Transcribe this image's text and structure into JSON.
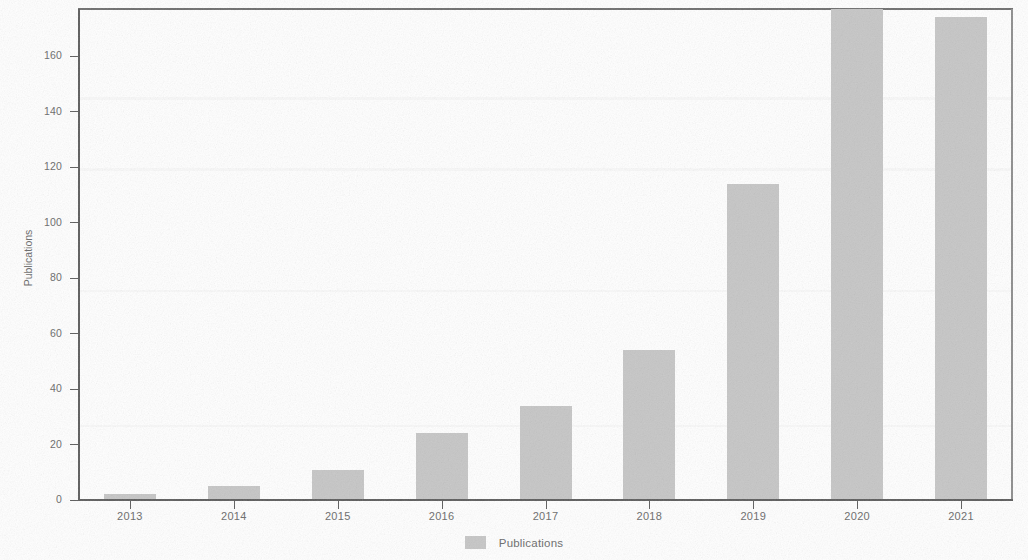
{
  "chart_data": {
    "type": "bar",
    "title": "",
    "subtitle": "",
    "xlabel": "",
    "ylabel": "Publications",
    "categories": [
      "2013",
      "2014",
      "2015",
      "2016",
      "2017",
      "2018",
      "2019",
      "2020",
      "2021"
    ],
    "values": [
      2,
      5,
      11,
      24,
      34,
      54,
      114,
      177,
      174
    ],
    "series": [
      {
        "name": "Publications",
        "values": [
          2,
          5,
          11,
          24,
          34,
          54,
          114,
          177,
          174
        ],
        "color": "#c6c6c6"
      }
    ],
    "ylim": [
      0,
      177
    ],
    "yticks": [
      0,
      20,
      40,
      60,
      80,
      100,
      120,
      140,
      160
    ],
    "ytick_labels": [
      "0",
      "20",
      "40",
      "60",
      "80",
      "100",
      "120",
      "140",
      "160"
    ],
    "xtick_labels": [
      "2013",
      "2014",
      "2015",
      "2016",
      "2017",
      "2018",
      "2019",
      "2020",
      "2021"
    ],
    "grid": false,
    "legend": {
      "position": "bottom-center",
      "entries": [
        {
          "label": "Publications",
          "color": "#c6c6c6"
        }
      ]
    },
    "style": {
      "bar_color": "#c6c6c6",
      "axis_color": "#5c5c5c",
      "text_color": "#6a6a6a",
      "background": "#ffffff",
      "appearance": "scanned-grayscale"
    }
  }
}
